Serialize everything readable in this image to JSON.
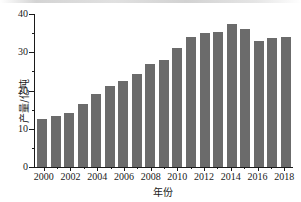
{
  "chart_data": {
    "type": "bar",
    "title": "",
    "xlabel": "年份",
    "ylabel": "产量/亿吨",
    "categories": [
      "2000",
      "2001",
      "2002",
      "2003",
      "2004",
      "2005",
      "2006",
      "2007",
      "2008",
      "2009",
      "2010",
      "2011",
      "2012",
      "2013",
      "2014",
      "2015",
      "2016",
      "2017",
      "2018"
    ],
    "values": [
      12.5,
      13.4,
      14.0,
      16.6,
      19.2,
      21.1,
      22.4,
      24.3,
      27.0,
      28.0,
      31.2,
      33.9,
      35.1,
      35.3,
      37.4,
      36.2,
      32.9,
      33.8,
      34.1
    ],
    "ylim": [
      0,
      40
    ],
    "yticks": [
      0,
      10,
      20,
      30,
      40
    ],
    "yticklabels": [
      "0",
      "10",
      "20",
      "30",
      "40"
    ],
    "yminorticks": [
      5,
      15,
      25,
      35
    ],
    "xticklabels": [
      "2000",
      "2002",
      "2004",
      "2006",
      "2008",
      "2010",
      "2012",
      "2014",
      "2016",
      "2018"
    ],
    "grid": false,
    "legend": false,
    "legend_position": "none",
    "bar_color": "#6b6b6b",
    "axis_color": "#1a1a1a",
    "background_color": "#ffffff"
  }
}
